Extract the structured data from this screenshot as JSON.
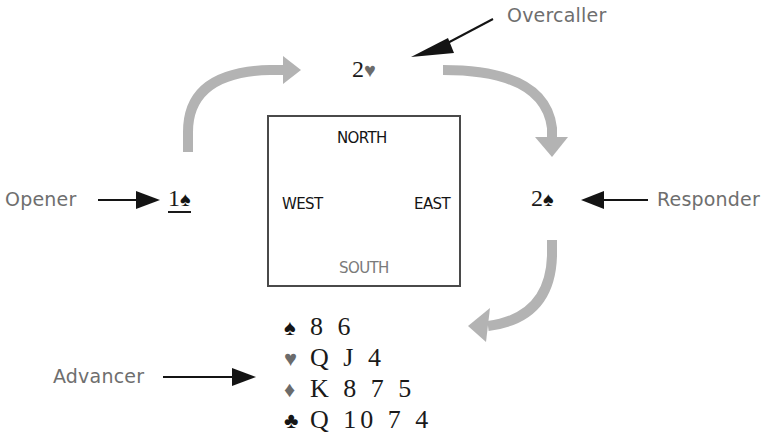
{
  "diagram": {
    "compass": {
      "north": "NORTH",
      "south": "SOUTH",
      "east": "EAST",
      "west": "WEST"
    },
    "roles": {
      "opener": "Opener",
      "overcaller": "Overcaller",
      "responder": "Responder",
      "advancer": "Advancer"
    },
    "bids": {
      "opener": {
        "level": "1",
        "suit": "♠",
        "suit_name": "spades",
        "underlined": true
      },
      "overcaller": {
        "level": "2",
        "suit": "♥",
        "suit_name": "hearts"
      },
      "responder": {
        "level": "2",
        "suit": "♠",
        "suit_name": "spades"
      }
    },
    "advancer_hand": [
      {
        "suit": "♠",
        "suit_name": "spades",
        "cards": "8 6"
      },
      {
        "suit": "♥",
        "suit_name": "hearts",
        "cards": "Q J 4"
      },
      {
        "suit": "♦",
        "suit_name": "diamonds",
        "cards": "K 8 7 5"
      },
      {
        "suit": "♣",
        "suit_name": "clubs",
        "cards": "Q 10 7 4"
      }
    ],
    "colors": {
      "flow_arrow": "#b3b3b3",
      "pointer_arrow": "#141414",
      "label_text": "#6e6e6e",
      "box_border": "#4a4a4a"
    }
  }
}
